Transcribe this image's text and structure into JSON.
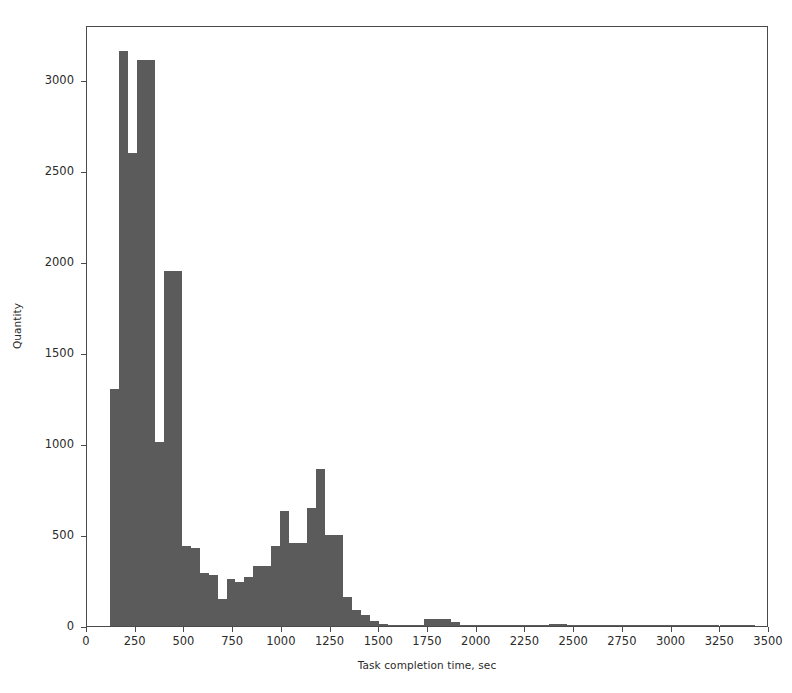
{
  "chart_data": {
    "type": "bar",
    "title": "",
    "subtitle": "",
    "xlabel": "Task completion time, sec",
    "ylabel": "Quantity",
    "xlim": [
      0,
      3500
    ],
    "ylim": [
      0,
      3300
    ],
    "xticks": [
      0,
      250,
      500,
      750,
      1000,
      1250,
      1500,
      1750,
      2000,
      2250,
      2500,
      2750,
      3000,
      3250,
      3500
    ],
    "yticks": [
      0,
      500,
      1000,
      1500,
      2000,
      2500,
      3000
    ],
    "grid": false,
    "legend": null,
    "bar_color": "#5b5b5b",
    "bin_width": 46,
    "note": "histogram of task completion times; bimodal with dominant peak near 250 sec and secondary peak near 1180 sec",
    "bins": [
      {
        "start": 118,
        "end": 164,
        "value": 1300
      },
      {
        "start": 164,
        "end": 210,
        "value": 3160
      },
      {
        "start": 210,
        "end": 256,
        "value": 2600
      },
      {
        "start": 256,
        "end": 302,
        "value": 3110
      },
      {
        "start": 302,
        "end": 348,
        "value": 3110
      },
      {
        "start": 348,
        "end": 394,
        "value": 1010
      },
      {
        "start": 394,
        "end": 440,
        "value": 1950
      },
      {
        "start": 440,
        "end": 486,
        "value": 1950
      },
      {
        "start": 486,
        "end": 532,
        "value": 440
      },
      {
        "start": 532,
        "end": 578,
        "value": 430
      },
      {
        "start": 578,
        "end": 624,
        "value": 290
      },
      {
        "start": 624,
        "end": 670,
        "value": 280
      },
      {
        "start": 670,
        "end": 716,
        "value": 150
      },
      {
        "start": 716,
        "end": 762,
        "value": 260
      },
      {
        "start": 762,
        "end": 808,
        "value": 240
      },
      {
        "start": 808,
        "end": 854,
        "value": 270
      },
      {
        "start": 854,
        "end": 900,
        "value": 330
      },
      {
        "start": 900,
        "end": 946,
        "value": 330
      },
      {
        "start": 946,
        "end": 992,
        "value": 440
      },
      {
        "start": 992,
        "end": 1038,
        "value": 630
      },
      {
        "start": 1038,
        "end": 1084,
        "value": 455
      },
      {
        "start": 1084,
        "end": 1130,
        "value": 455
      },
      {
        "start": 1130,
        "end": 1176,
        "value": 650
      },
      {
        "start": 1176,
        "end": 1222,
        "value": 860
      },
      {
        "start": 1222,
        "end": 1268,
        "value": 500
      },
      {
        "start": 1268,
        "end": 1314,
        "value": 500
      },
      {
        "start": 1314,
        "end": 1360,
        "value": 160
      },
      {
        "start": 1360,
        "end": 1406,
        "value": 90
      },
      {
        "start": 1406,
        "end": 1452,
        "value": 60
      },
      {
        "start": 1452,
        "end": 1498,
        "value": 25
      },
      {
        "start": 1498,
        "end": 1544,
        "value": 12
      },
      {
        "start": 1544,
        "end": 1590,
        "value": 8
      },
      {
        "start": 1590,
        "end": 1636,
        "value": 5
      },
      {
        "start": 1636,
        "end": 1682,
        "value": 4
      },
      {
        "start": 1682,
        "end": 1728,
        "value": 4
      },
      {
        "start": 1728,
        "end": 1774,
        "value": 40
      },
      {
        "start": 1774,
        "end": 1820,
        "value": 40
      },
      {
        "start": 1820,
        "end": 1866,
        "value": 40
      },
      {
        "start": 1866,
        "end": 1912,
        "value": 22
      },
      {
        "start": 1912,
        "end": 1958,
        "value": 8
      },
      {
        "start": 1958,
        "end": 2004,
        "value": 4
      },
      {
        "start": 2004,
        "end": 2050,
        "value": 3
      },
      {
        "start": 2050,
        "end": 2096,
        "value": 2
      },
      {
        "start": 2096,
        "end": 2142,
        "value": 2
      },
      {
        "start": 2142,
        "end": 2188,
        "value": 2
      },
      {
        "start": 2188,
        "end": 2234,
        "value": 2
      },
      {
        "start": 2234,
        "end": 2280,
        "value": 2
      },
      {
        "start": 2280,
        "end": 2326,
        "value": 2
      },
      {
        "start": 2326,
        "end": 2372,
        "value": 2
      },
      {
        "start": 2372,
        "end": 2418,
        "value": 10
      },
      {
        "start": 2418,
        "end": 2464,
        "value": 10
      },
      {
        "start": 2464,
        "end": 2510,
        "value": 3
      },
      {
        "start": 2510,
        "end": 2556,
        "value": 2
      },
      {
        "start": 2556,
        "end": 2602,
        "value": 2
      },
      {
        "start": 2602,
        "end": 2648,
        "value": 1
      },
      {
        "start": 2648,
        "end": 2694,
        "value": 1
      },
      {
        "start": 2694,
        "end": 2740,
        "value": 1
      },
      {
        "start": 2740,
        "end": 2786,
        "value": 1
      },
      {
        "start": 2786,
        "end": 2832,
        "value": 1
      },
      {
        "start": 2832,
        "end": 2878,
        "value": 1
      },
      {
        "start": 2878,
        "end": 2924,
        "value": 1
      },
      {
        "start": 2924,
        "end": 2970,
        "value": 1
      },
      {
        "start": 2970,
        "end": 3016,
        "value": 1
      },
      {
        "start": 3016,
        "end": 3062,
        "value": 1
      },
      {
        "start": 3062,
        "end": 3108,
        "value": 1
      },
      {
        "start": 3108,
        "end": 3154,
        "value": 1
      },
      {
        "start": 3154,
        "end": 3200,
        "value": 1
      },
      {
        "start": 3200,
        "end": 3246,
        "value": 1
      },
      {
        "start": 3246,
        "end": 3292,
        "value": 1
      },
      {
        "start": 3292,
        "end": 3338,
        "value": 1
      },
      {
        "start": 3338,
        "end": 3384,
        "value": 1
      },
      {
        "start": 3384,
        "end": 3430,
        "value": 1
      }
    ]
  }
}
